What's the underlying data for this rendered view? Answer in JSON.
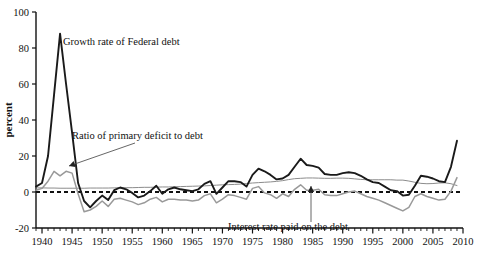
{
  "chart_data": {
    "type": "line",
    "title": "",
    "xlabel": "",
    "ylabel": "percent",
    "xlim": [
      1939,
      2010
    ],
    "ylim": [
      -20,
      100
    ],
    "grid": false,
    "legend_position": "inline-annotations",
    "y_ticks": [
      -20,
      0,
      20,
      40,
      60,
      80,
      100
    ],
    "y_tick_labels": [
      "-20",
      "0",
      "20",
      "40",
      "60",
      "80",
      "100"
    ],
    "x_ticks": [
      1940,
      1945,
      1950,
      1955,
      1960,
      1965,
      1970,
      1975,
      1980,
      1985,
      1990,
      1995,
      2000,
      2005,
      2010
    ],
    "x_tick_labels": [
      "1940",
      "1945",
      "1950",
      "1955",
      "1960",
      "1965",
      "1970",
      "1975",
      "1980",
      "1985",
      "1990",
      "1995",
      "2000",
      "2005",
      "2010"
    ],
    "x_minor_tick_step": 1,
    "zero_line": 0,
    "zero_line_style": "dashed",
    "annotations": [
      {
        "name": "growth-rate-of-federal-debt",
        "text": "Growth rate of Federal debt",
        "text_x": 63,
        "text_y": 45,
        "has_arrow": false
      },
      {
        "name": "ratio-of-primary-deficit-to-debt",
        "text": "Ratio of primary deficit to debt",
        "text_x": 72,
        "text_y": 139,
        "has_arrow": true,
        "arrow_from_x": 135,
        "arrow_from_y": 143,
        "arrow_to_x": 69,
        "arrow_to_y": 166
      },
      {
        "name": "interest-rate-paid-on-the-debt",
        "text": "Interest rate paid on the debt",
        "text_x": 228,
        "text_y": 230,
        "has_arrow": true,
        "arrow_from_x": 311,
        "arrow_from_y": 222,
        "arrow_to_x": 311,
        "arrow_to_y": 186
      }
    ],
    "series": [
      {
        "name": "Growth rate of Federal debt",
        "color": "#1a1a1a",
        "width": 1.9,
        "style": "solid",
        "x": [
          1939,
          1940,
          1941,
          1942,
          1943,
          1944,
          1945,
          1946,
          1947,
          1948,
          1949,
          1950,
          1951,
          1952,
          1953,
          1954,
          1955,
          1956,
          1957,
          1958,
          1959,
          1960,
          1961,
          1962,
          1963,
          1964,
          1965,
          1966,
          1967,
          1968,
          1969,
          1970,
          1971,
          1972,
          1973,
          1974,
          1975,
          1976,
          1977,
          1978,
          1979,
          1980,
          1981,
          1982,
          1983,
          1984,
          1985,
          1986,
          1987,
          1988,
          1989,
          1990,
          1991,
          1992,
          1993,
          1994,
          1995,
          1996,
          1997,
          1998,
          1999,
          2000,
          2001,
          2002,
          2003,
          2004,
          2005,
          2006,
          2007,
          2008,
          2009
        ],
        "values": [
          3.0,
          5.0,
          20.0,
          54.0,
          88.0,
          60.0,
          33.0,
          5.0,
          -5.0,
          -8.5,
          -5.0,
          -2.0,
          -4.5,
          1.0,
          2.5,
          1.5,
          -0.5,
          -3.0,
          -2.0,
          0.5,
          3.5,
          -1.0,
          1.5,
          2.5,
          1.5,
          1.0,
          0.5,
          1.5,
          4.5,
          6.0,
          -1.0,
          2.5,
          6.0,
          6.0,
          5.5,
          3.0,
          9.5,
          13.0,
          11.5,
          9.5,
          7.0,
          7.5,
          9.5,
          14.0,
          18.5,
          15.0,
          14.5,
          13.5,
          10.0,
          9.5,
          9.5,
          10.5,
          11.0,
          10.5,
          9.0,
          7.0,
          5.5,
          5.0,
          3.0,
          1.0,
          0.5,
          -2.0,
          -1.5,
          3.5,
          9.0,
          8.5,
          7.5,
          6.0,
          5.5,
          14.0,
          28.5
        ]
      },
      {
        "name": "Ratio of primary deficit to debt",
        "color": "#999999",
        "width": 1.5,
        "style": "solid",
        "x": [
          1939,
          1940,
          1941,
          1942,
          1943,
          1944,
          1945,
          1946,
          1947,
          1948,
          1949,
          1950,
          1951,
          1952,
          1953,
          1954,
          1955,
          1956,
          1957,
          1958,
          1959,
          1960,
          1961,
          1962,
          1963,
          1964,
          1965,
          1966,
          1967,
          1968,
          1969,
          1970,
          1971,
          1972,
          1973,
          1974,
          1975,
          1976,
          1977,
          1978,
          1979,
          1980,
          1981,
          1982,
          1983,
          1984,
          1985,
          1986,
          1987,
          1988,
          1989,
          1990,
          1991,
          1992,
          1993,
          1994,
          1995,
          1996,
          1997,
          1998,
          1999,
          2000,
          2001,
          2002,
          2003,
          2004,
          2005,
          2006,
          2007,
          2008,
          2009
        ],
        "values": [
          1.0,
          2.0,
          6.0,
          11.5,
          9.0,
          11.5,
          10.5,
          -1.0,
          -11.0,
          -10.0,
          -8.0,
          -5.0,
          -8.0,
          -4.0,
          -3.5,
          -4.5,
          -5.5,
          -7.0,
          -6.0,
          -4.0,
          -3.0,
          -5.5,
          -4.0,
          -4.0,
          -4.5,
          -4.5,
          -5.0,
          -4.5,
          -2.0,
          -1.0,
          -6.0,
          -4.0,
          -1.5,
          -2.0,
          -3.0,
          -4.0,
          2.0,
          3.0,
          -0.5,
          -1.5,
          -3.5,
          -1.0,
          -2.5,
          1.5,
          4.0,
          1.0,
          1.0,
          1.5,
          -1.5,
          -2.0,
          -2.0,
          -1.0,
          0.0,
          0.5,
          -1.0,
          -2.5,
          -3.5,
          -4.5,
          -6.0,
          -7.5,
          -9.0,
          -10.5,
          -8.5,
          -2.5,
          -1.0,
          -2.5,
          -3.5,
          -4.5,
          -4.0,
          0.5,
          8.0
        ]
      },
      {
        "name": "Interest rate paid on the debt",
        "color": "#8c8c8c",
        "width": 1.0,
        "style": "solid",
        "x": [
          1939,
          1940,
          1941,
          1942,
          1943,
          1944,
          1945,
          1946,
          1947,
          1948,
          1949,
          1950,
          1951,
          1952,
          1953,
          1954,
          1955,
          1956,
          1957,
          1958,
          1959,
          1960,
          1961,
          1962,
          1963,
          1964,
          1965,
          1966,
          1967,
          1968,
          1969,
          1970,
          1971,
          1972,
          1973,
          1974,
          1975,
          1976,
          1977,
          1978,
          1979,
          1980,
          1981,
          1982,
          1983,
          1984,
          1985,
          1986,
          1987,
          1988,
          1989,
          1990,
          1991,
          1992,
          1993,
          1994,
          1995,
          1996,
          1997,
          1998,
          1999,
          2000,
          2001,
          2002,
          2003,
          2004,
          2005,
          2006,
          2007,
          2008,
          2009
        ],
        "values": [
          2.3,
          2.3,
          2.2,
          2.2,
          2.1,
          2.1,
          2.1,
          2.1,
          2.1,
          2.2,
          2.2,
          2.2,
          2.2,
          2.3,
          2.4,
          2.4,
          2.4,
          2.5,
          2.6,
          2.6,
          2.7,
          2.8,
          2.8,
          2.9,
          3.0,
          3.1,
          3.2,
          3.3,
          3.4,
          3.6,
          3.8,
          4.0,
          4.1,
          4.2,
          4.4,
          4.7,
          5.0,
          5.2,
          5.4,
          5.6,
          5.9,
          6.3,
          6.9,
          7.4,
          7.6,
          7.8,
          7.8,
          7.7,
          7.6,
          7.6,
          7.7,
          7.7,
          7.6,
          7.3,
          7.0,
          6.8,
          6.8,
          6.8,
          6.8,
          6.8,
          6.6,
          6.6,
          6.1,
          5.4,
          4.8,
          4.6,
          4.7,
          5.0,
          5.1,
          4.6,
          3.6
        ]
      }
    ]
  },
  "axes": {
    "y_axis_title": "percent"
  }
}
